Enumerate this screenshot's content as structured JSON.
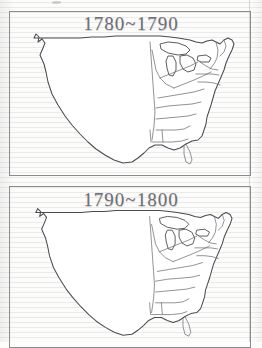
{
  "document": {
    "type": "worksheet-page",
    "medium": "photocopied lined notebook paper",
    "paper_color": "#fcfcfb",
    "rule_line_color": "#8c8c91",
    "margin_rule_color": "#78788030"
  },
  "maps": [
    {
      "id": "map-1780-1790",
      "title": "1780~1790",
      "subject": "blank United States outline map",
      "title_color": "#6f6f76",
      "frame_color": "#8b8b90",
      "outline_color": "#4a4a50",
      "state_border_color": "#6d6d74",
      "fill_color": "#ffffff",
      "features": [
        "continental-us-outline",
        "great-lakes",
        "florida-peninsula",
        "eastern-state-boundaries",
        "new-england-states"
      ]
    },
    {
      "id": "map-1790-1800",
      "title": "1790~1800",
      "subject": "blank United States outline map",
      "title_color": "#6f6f76",
      "frame_color": "#8b8b90",
      "outline_color": "#4a4a50",
      "state_border_color": "#6d6d74",
      "fill_color": "#ffffff",
      "cropped": "bottom edge cut off by page edge",
      "features": [
        "continental-us-outline",
        "great-lakes",
        "florida-peninsula",
        "eastern-state-boundaries",
        "new-england-states"
      ]
    }
  ]
}
